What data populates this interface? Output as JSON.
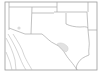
{
  "map": {
    "type": "outline-map",
    "area": "South-central United States and northern Mexico",
    "states_shown": [
      "Texas",
      "New Mexico",
      "Oklahoma",
      "Colorado",
      "Kansas",
      "Arizona",
      "Louisiana",
      "Arkansas"
    ],
    "highlighted_regions": [
      {
        "name": "central-texas-region",
        "color": "#d6d6d6"
      },
      {
        "name": "southern-new-mexico-spot",
        "color": "#dcdcdc"
      }
    ],
    "colors": {
      "background": "#ffffff",
      "border_lines": "#a8a8a8",
      "frame": "#9a9a9a",
      "highlight": "#d6d6d6"
    }
  }
}
